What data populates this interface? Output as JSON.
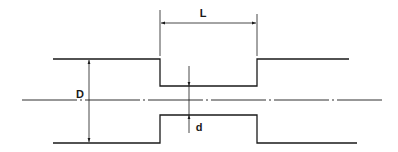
{
  "diagram": {
    "type": "technical-drawing",
    "labels": {
      "length": "L",
      "outer_diameter": "D",
      "inner_diameter": "d"
    },
    "colors": {
      "line": "#1a1a1a",
      "background": "#ffffff"
    }
  }
}
